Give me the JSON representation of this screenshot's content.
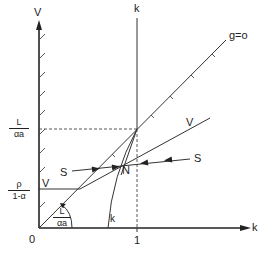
{
  "diagram": {
    "type": "economic-phase-diagram",
    "axes": {
      "vertical": {
        "label": "V"
      },
      "horizontal": {
        "label": "k"
      },
      "origin": {
        "label": "0"
      },
      "x_tick": {
        "label": "1"
      }
    },
    "y_ticks": {
      "upper": {
        "numerator": "L",
        "denominator": "αa"
      },
      "lower": {
        "numerator": "ρ",
        "denominator": "1-α"
      }
    },
    "curves": {
      "g_line": {
        "label": "g=o"
      },
      "k_vertical": {
        "label": "k"
      },
      "k_curve": {
        "label": "k"
      },
      "v_line_upper": {
        "label": "V"
      },
      "v_line_lower": {
        "label": "V"
      },
      "s_left": {
        "label": "S"
      },
      "s_right": {
        "label": "S"
      }
    },
    "points": {
      "equilibrium": {
        "label": "N"
      }
    },
    "angle_label": {
      "numerator": "L",
      "denominator": "αa"
    },
    "colors": {
      "ink": "#222222",
      "background": "#ffffff"
    }
  }
}
